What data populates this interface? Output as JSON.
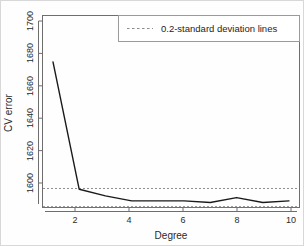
{
  "chart_data": {
    "type": "line",
    "title": "",
    "xlabel": "Degree",
    "ylabel": "CV error",
    "xlim": [
      0.6,
      10.4
    ],
    "ylim": [
      1587,
      1703
    ],
    "grid": false,
    "x": [
      1,
      2,
      3,
      4,
      5,
      6,
      7,
      8,
      9,
      10
    ],
    "series": [
      {
        "name": "CV error",
        "values": [
          1675,
          1598,
          1594,
          1591,
          1591,
          1591,
          1590,
          1593,
          1590,
          1591
        ],
        "color": "#1a1a1a",
        "style": "solid"
      }
    ],
    "reference_lines": [
      {
        "name": "upper 0.2-sd line",
        "y": 1598.5,
        "style": "dashed",
        "color": "#8c8c8c"
      },
      {
        "name": "lower 0.2-sd line",
        "y": 1587.5,
        "style": "dashed",
        "color": "#8c8c8c"
      }
    ],
    "xticks": [
      2,
      4,
      6,
      8,
      10
    ],
    "xtick_labels": [
      "2",
      "4",
      "6",
      "8",
      "10"
    ],
    "yticks": [
      1600,
      1620,
      1640,
      1660,
      1680,
      1700
    ],
    "ytick_labels": [
      "1600",
      "1620",
      "1640",
      "1660",
      "1680",
      "1700"
    ],
    "legend": {
      "position": "top-right",
      "entries": [
        {
          "label": "0.2-standard deviation lines",
          "style": "dashed",
          "color": "#8c8c8c"
        }
      ]
    }
  },
  "axis": {
    "x_label": "Degree",
    "y_label": "CV error"
  },
  "yticks": {
    "t0": "1600",
    "t1": "1620",
    "t2": "1640",
    "t3": "1660",
    "t4": "1680",
    "t5": "1700"
  },
  "xticks": {
    "t0": "2",
    "t1": "4",
    "t2": "6",
    "t3": "8",
    "t4": "10"
  },
  "legend": {
    "entry0": "0.2-standard deviation lines"
  }
}
